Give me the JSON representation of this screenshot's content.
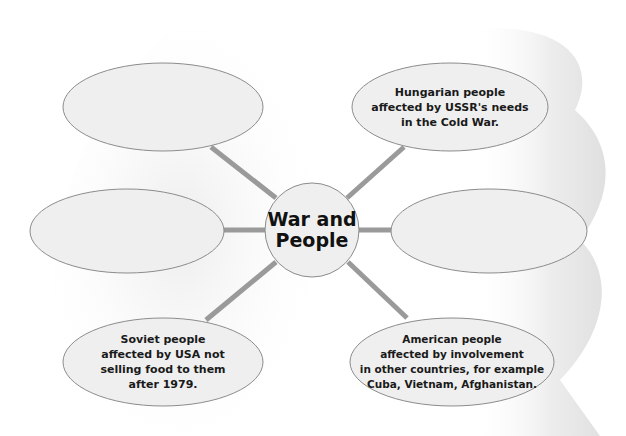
{
  "diagram": {
    "type": "mind-map",
    "center": {
      "label_line1": "War and",
      "label_line2": "People"
    },
    "nodes": [
      {
        "position": "top-left",
        "text": ""
      },
      {
        "position": "top-right",
        "lines": [
          "Hungarian people",
          "affected by USSR's needs",
          "in the Cold War."
        ]
      },
      {
        "position": "middle-left",
        "text": ""
      },
      {
        "position": "middle-right",
        "text": ""
      },
      {
        "position": "bottom-left",
        "lines": [
          "Soviet people",
          "affected by USA not",
          "selling food to them",
          "after 1979."
        ]
      },
      {
        "position": "bottom-right",
        "lines": [
          "American people",
          "affected by involvement",
          "in other countries, for example",
          "Cuba, Vietnam, Afghanistan."
        ]
      }
    ],
    "colors": {
      "ellipse_fill": "#efefef",
      "ellipse_stroke": "#8c8c8c",
      "connector": "#999999",
      "background_shadow": "#ececec"
    }
  }
}
